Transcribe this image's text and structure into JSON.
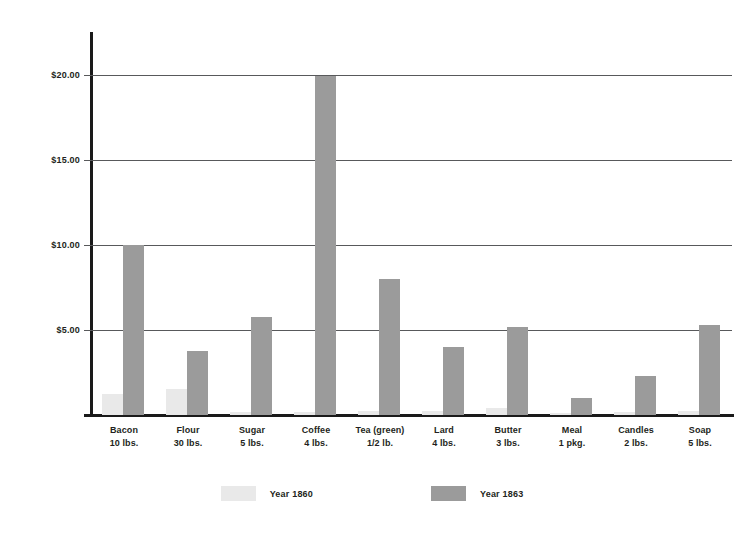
{
  "chart_data": {
    "type": "bar",
    "title": "",
    "xlabel": "",
    "ylabel": "",
    "ylim": [
      0,
      22.5
    ],
    "grid": true,
    "legend_position": "bottom",
    "y_ticks": [
      {
        "value": 5,
        "label": "$5.00"
      },
      {
        "value": 10,
        "label": "$10.00"
      },
      {
        "value": 15,
        "label": "$15.00"
      },
      {
        "value": 20,
        "label": "$20.00"
      }
    ],
    "categories": [
      {
        "name": "Bacon",
        "unit": "10 lbs."
      },
      {
        "name": "Flour",
        "unit": "30 lbs."
      },
      {
        "name": "Sugar",
        "unit": "5 lbs."
      },
      {
        "name": "Coffee",
        "unit": "4 lbs."
      },
      {
        "name": "Tea (green)",
        "unit": "1/2 lb."
      },
      {
        "name": "Lard",
        "unit": "4 lbs."
      },
      {
        "name": "Butter",
        "unit": "3 lbs."
      },
      {
        "name": "Meal",
        "unit": "1 pkg."
      },
      {
        "name": "Candles",
        "unit": "2 lbs."
      },
      {
        "name": "Soap",
        "unit": "5 lbs."
      }
    ],
    "series": [
      {
        "name": "Year 1860",
        "color": "#e9e9e9",
        "values": [
          1.25,
          1.5,
          0.2,
          0.18,
          0.25,
          0.25,
          0.4,
          0.12,
          0.15,
          0.22
        ]
      },
      {
        "name": "Year 1863",
        "color": "#9b9b9b",
        "values": [
          10.0,
          3.75,
          5.75,
          19.9,
          8.0,
          4.0,
          5.2,
          1.0,
          2.3,
          5.3
        ]
      }
    ]
  },
  "legend": {
    "items": [
      {
        "label": "Year 1860",
        "color": "#e9e9e9"
      },
      {
        "label": "Year 1863",
        "color": "#9b9b9b"
      }
    ]
  },
  "colors": {
    "series_1860": "#e9e9e9",
    "series_1863": "#9b9b9b",
    "axis": "#1a1a1a",
    "gridline": "#58595b",
    "text": "#231f20",
    "background": "#ffffff"
  }
}
